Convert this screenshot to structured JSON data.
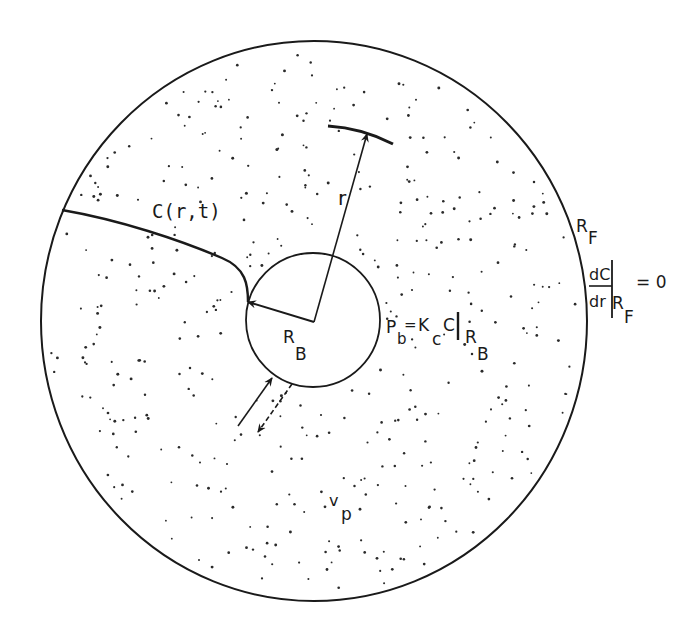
{
  "diagram": {
    "colors": {
      "ink": "#1a1a1a",
      "background": "#ffffff"
    },
    "labels": {
      "concentration": "C(r,t)",
      "radius": "r",
      "outer_radius": {
        "main": "R",
        "sub": "F"
      },
      "inner_radius": {
        "main": "R",
        "sub": "B"
      },
      "pore_volume": {
        "main": "v",
        "sub": "p"
      },
      "inner_bc": {
        "lhs_main": "P",
        "lhs_sub": "b",
        "eq": "=",
        "k_main": "K",
        "k_sub": "c",
        "c": "C",
        "eval_main": "R",
        "eval_sub": "B"
      },
      "outer_bc": {
        "numerator": "dC",
        "denominator": "dr",
        "eval_main": "R",
        "eval_sub": "F",
        "rhs": "= 0"
      }
    },
    "elements": [
      "outer-sphere (radius R_F, stippled porous region)",
      "inner-sphere (radius R_B, bound region)",
      "radius-arrow r to spherical shell arc",
      "concentration profile curve C(r,t)",
      "exchange arrows (solid inward, dashed outward) across inner boundary"
    ]
  }
}
